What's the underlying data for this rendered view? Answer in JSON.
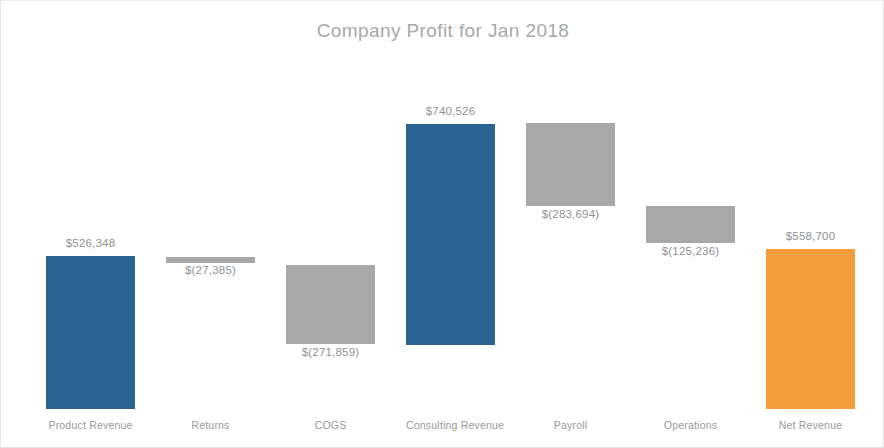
{
  "chart_data": {
    "type": "bar",
    "subtype": "waterfall",
    "title": "Company Profit for Jan 2018",
    "xlabel": "",
    "ylabel": "",
    "grid": false,
    "legend": false,
    "axis_labels_visible": false,
    "categories": [
      "Product Revenue",
      "Returns",
      "COGS",
      "Consulting Revenue",
      "Payroll",
      "Operations",
      "Net Revenue"
    ],
    "values": [
      526348,
      -27385,
      -271859,
      740526,
      -283694,
      -125236,
      558700
    ],
    "data_labels": [
      "$526,348",
      "$(27,385)",
      "$(271,859)",
      "$740,526",
      "$(283,694)",
      "$(125,236)",
      "$558,700"
    ],
    "bar_kinds": [
      "positive",
      "negative",
      "negative",
      "positive",
      "negative",
      "negative",
      "total"
    ],
    "cumulative_start": [
      0,
      526348,
      498963,
      227104,
      967630,
      683936,
      0
    ],
    "cumulative_end": [
      526348,
      498963,
      227104,
      967630,
      683936,
      558700,
      558700
    ],
    "ylim": [
      0,
      1000000
    ],
    "colors": {
      "positive": "#2a6292",
      "negative": "#a8a8a8",
      "total": "#f39c3c",
      "title_text": "#a6a8ab",
      "label_text": "#8e9194",
      "category_text": "#97999c",
      "background": "#ffffff",
      "frame_border": "#e3e3e3"
    },
    "bars": [
      {
        "category": "Product Revenue",
        "label": "$526,348",
        "kind": "positive",
        "left": 45,
        "width": 89,
        "top": 255,
        "height": 153,
        "label_top": 236
      },
      {
        "category": "Returns",
        "label": "$(27,385)",
        "kind": "negative",
        "left": 165,
        "width": 89,
        "top": 256,
        "height": 6,
        "label_top": 263
      },
      {
        "category": "COGS",
        "label": "$(271,859)",
        "kind": "negative",
        "left": 285,
        "width": 89,
        "top": 264,
        "height": 79,
        "label_top": 345
      },
      {
        "category": "Consulting Revenue",
        "label": "$740,526",
        "kind": "positive",
        "left": 405,
        "width": 89,
        "top": 123,
        "height": 221,
        "label_top": 104
      },
      {
        "category": "Payroll",
        "label": "$(283,694)",
        "kind": "negative",
        "left": 525,
        "width": 89,
        "top": 122,
        "height": 83,
        "label_top": 207
      },
      {
        "category": "Operations",
        "label": "$(125,236)",
        "kind": "negative",
        "left": 645,
        "width": 89,
        "top": 205,
        "height": 37,
        "label_top": 244
      },
      {
        "category": "Net Revenue",
        "label": "$558,700",
        "kind": "total",
        "left": 765,
        "width": 89,
        "top": 248,
        "height": 160,
        "label_top": 229
      }
    ]
  }
}
